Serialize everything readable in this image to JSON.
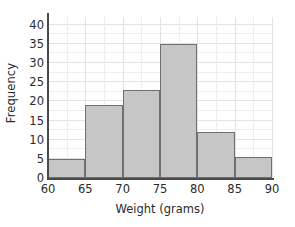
{
  "chart_data": {
    "type": "bar",
    "title": "",
    "subtitle": "",
    "xlabel": "Weight (grams)",
    "ylabel": "Frequency",
    "categories": [
      "60-65",
      "65-70",
      "70-75",
      "75-80",
      "80-85",
      "85-90"
    ],
    "bin_edges": [
      60,
      65,
      70,
      75,
      80,
      85,
      90
    ],
    "values": [
      5,
      19,
      23,
      35,
      12,
      5.5
    ],
    "xlim": [
      60,
      90
    ],
    "ylim": [
      0,
      42
    ],
    "xticks": [
      60,
      65,
      70,
      75,
      80,
      85,
      90
    ],
    "yticks": [
      0,
      5,
      10,
      15,
      20,
      25,
      30,
      35,
      40
    ],
    "xtick_labels": [
      "60",
      "65",
      "70",
      "75",
      "80",
      "85",
      "90"
    ],
    "ytick_labels": [
      "0",
      "5",
      "10",
      "15",
      "20",
      "25",
      "30",
      "35",
      "40"
    ],
    "grid": true,
    "grid_minor": true,
    "legend": false,
    "legend_position": "none",
    "bar_fill_color": "#c6c6c6",
    "bar_edge_color": "#6f6f6f",
    "axis_color": "#4a4a4a",
    "grid_color": "#e2e2e2",
    "text_color": "#2b2b2b",
    "background_color": "#ffffff"
  }
}
